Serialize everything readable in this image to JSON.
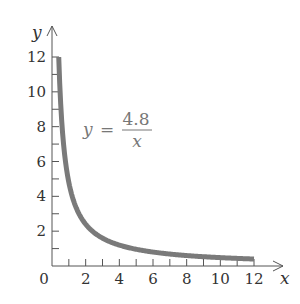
{
  "chart_data": {
    "type": "line",
    "title": "",
    "xlabel": "x",
    "ylabel": "y",
    "xlim": [
      0,
      12
    ],
    "ylim": [
      0,
      12
    ],
    "x_ticks": [
      2,
      4,
      6,
      8,
      10,
      12
    ],
    "x_minor_ticks": [
      1,
      3,
      5,
      7,
      9,
      11
    ],
    "y_ticks": [
      2,
      4,
      6,
      8,
      10,
      12
    ],
    "y_minor_ticks": [
      1,
      3,
      5,
      7,
      9,
      11
    ],
    "origin_label": "0",
    "grid": false,
    "annotation": {
      "lhs": "y",
      "equals": "=",
      "numerator": "4.8",
      "denominator": "x"
    },
    "series": [
      {
        "name": "y = 4.8/x",
        "color": "#7a7a7a",
        "x": [
          0.4,
          0.5,
          0.6,
          0.8,
          1,
          1.2,
          1.5,
          2,
          2.5,
          3,
          4,
          5,
          6,
          7,
          8,
          9,
          10,
          11,
          12
        ],
        "y": [
          12,
          9.6,
          8,
          6,
          4.8,
          4,
          3.2,
          2.4,
          1.92,
          1.6,
          1.2,
          0.96,
          0.8,
          0.686,
          0.6,
          0.533,
          0.48,
          0.436,
          0.4
        ]
      }
    ]
  }
}
